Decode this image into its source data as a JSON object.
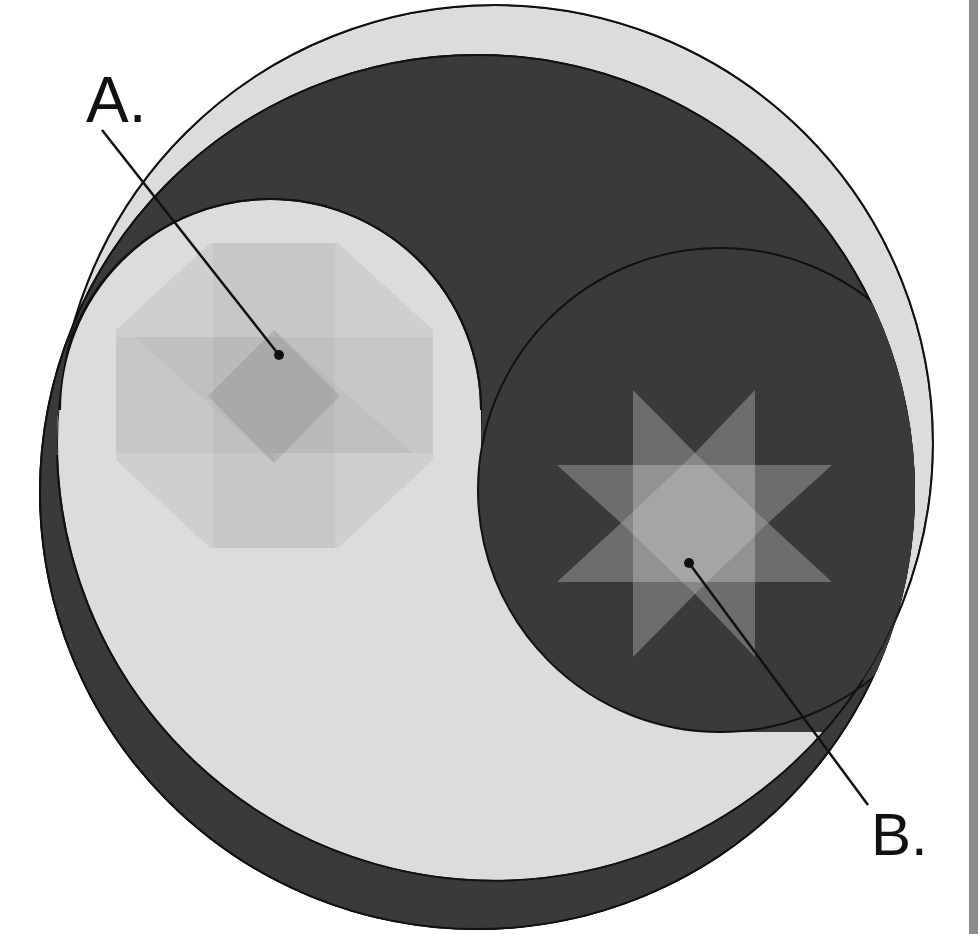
{
  "figure": {
    "type": "yin-yang diagram with inset symbols",
    "colors": {
      "background": "#ffffff",
      "light_region": "#dcdcdc",
      "dark_region": "#3a3a3a",
      "outline": "#111111",
      "edge_strip": "#8c8c8c"
    },
    "labels": {
      "a": "A.",
      "b": "B."
    },
    "callouts": [
      {
        "label": "A.",
        "target": "octagon-pattern",
        "line": [
          102,
          130,
          279,
          355
        ]
      },
      {
        "label": "B.",
        "target": "eight-point-star",
        "line": [
          689,
          563,
          868,
          805
        ]
      }
    ],
    "shapes": {
      "light_outer": {
        "cx": 495,
        "cy": 443,
        "r": 438
      },
      "dark_outer": {
        "cx": 477,
        "cy": 492,
        "r": 438
      },
      "light_lobe": {
        "cx": 270,
        "cy": 410,
        "r": 211
      },
      "dark_lobe": {
        "cx": 720,
        "cy": 490,
        "r": 242
      },
      "octagon_symbol": {
        "center": [
          274,
          396
        ],
        "description": "octagon of overlapping translucent grey bands and diamond"
      },
      "star_symbol": {
        "center": [
          695,
          523
        ],
        "description": "eight-point star of overlapping translucent light bands"
      }
    }
  }
}
